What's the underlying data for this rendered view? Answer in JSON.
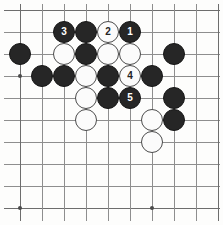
{
  "figure": {
    "kind": "go-board-diagram",
    "width": 223,
    "height": 225
  },
  "board": {
    "columns": 10,
    "rows": 10,
    "cell_size": 22,
    "origin_x": 20,
    "origin_y": 10,
    "line_color": "#8e8e8e",
    "edge_color": "#6d6d6d",
    "background_color": "#fdfdfc",
    "black_color": "#262626",
    "white_color": "#fbfbfb",
    "white_outline_color": "#4b4b4b",
    "star_points": [
      {
        "col": 0,
        "row": 3
      },
      {
        "col": 0,
        "row": 9
      },
      {
        "col": 6,
        "row": 9
      }
    ]
  },
  "stones": [
    {
      "col": 2,
      "row": 1,
      "color": "black",
      "label": "3"
    },
    {
      "col": 3,
      "row": 1,
      "color": "black",
      "label": ""
    },
    {
      "col": 4,
      "row": 1,
      "color": "white",
      "label": "2"
    },
    {
      "col": 5,
      "row": 1,
      "color": "black",
      "label": "1"
    },
    {
      "col": 0,
      "row": 2,
      "color": "black",
      "label": ""
    },
    {
      "col": 2,
      "row": 2,
      "color": "white",
      "label": ""
    },
    {
      "col": 3,
      "row": 2,
      "color": "black",
      "label": ""
    },
    {
      "col": 4,
      "row": 2,
      "color": "white",
      "label": ""
    },
    {
      "col": 5,
      "row": 2,
      "color": "white",
      "label": ""
    },
    {
      "col": 7,
      "row": 2,
      "color": "black",
      "label": ""
    },
    {
      "col": 1,
      "row": 3,
      "color": "black",
      "label": ""
    },
    {
      "col": 2,
      "row": 3,
      "color": "black",
      "label": ""
    },
    {
      "col": 3,
      "row": 3,
      "color": "white",
      "label": ""
    },
    {
      "col": 4,
      "row": 3,
      "color": "black",
      "label": ""
    },
    {
      "col": 5,
      "row": 3,
      "color": "white",
      "label": "4"
    },
    {
      "col": 6,
      "row": 3,
      "color": "black",
      "label": ""
    },
    {
      "col": 3,
      "row": 4,
      "color": "white",
      "label": ""
    },
    {
      "col": 4,
      "row": 4,
      "color": "black",
      "label": ""
    },
    {
      "col": 5,
      "row": 4,
      "color": "black",
      "label": "5"
    },
    {
      "col": 7,
      "row": 4,
      "color": "black",
      "label": ""
    },
    {
      "col": 3,
      "row": 5,
      "color": "white",
      "label": ""
    },
    {
      "col": 6,
      "row": 5,
      "color": "white",
      "label": ""
    },
    {
      "col": 7,
      "row": 5,
      "color": "black",
      "label": ""
    },
    {
      "col": 6,
      "row": 6,
      "color": "white",
      "label": ""
    }
  ],
  "move_sequence": [
    {
      "number": "1",
      "color": "black",
      "col": 5,
      "row": 1
    },
    {
      "number": "2",
      "color": "white",
      "col": 4,
      "row": 1
    },
    {
      "number": "3",
      "color": "black",
      "col": 2,
      "row": 1
    },
    {
      "number": "4",
      "color": "white",
      "col": 5,
      "row": 3
    },
    {
      "number": "5",
      "color": "black",
      "col": 5,
      "row": 4
    }
  ]
}
